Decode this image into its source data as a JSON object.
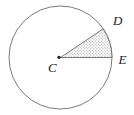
{
  "figure": {
    "type": "geometry-circle-with-sector",
    "labels": {
      "center": "C",
      "point_d": "D",
      "point_e": "E"
    },
    "colors": {
      "background": "#ffffff",
      "circle_outline": "#7a7a7a",
      "sector_edge": "#6e6e6e",
      "sector_dot": "#b0b0b0",
      "sector_base": "#f6f6f6",
      "center_dot": "#1a1a1a",
      "label_text": "#1a1a1a"
    }
  }
}
